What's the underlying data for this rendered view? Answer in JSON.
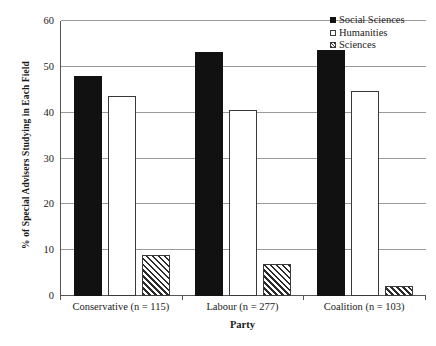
{
  "chart_data": {
    "type": "bar",
    "title": "",
    "xlabel": "Party",
    "ylabel": "% of Special Advisers Studying in Each Field",
    "categories": [
      "Conservative (n = 115)",
      "Labour (n = 277)",
      "Coalition (n = 103)"
    ],
    "series": [
      {
        "name": "Social Sciences",
        "values": [
          48.0,
          53.2,
          53.7
        ],
        "style": "solid-black"
      },
      {
        "name": "Humanities",
        "values": [
          43.6,
          40.6,
          44.8
        ],
        "style": "hollow-white"
      },
      {
        "name": "Sciences",
        "values": [
          9.0,
          7.0,
          2.2
        ],
        "style": "diagonal-hatch"
      }
    ],
    "ylim": [
      0,
      60
    ],
    "yticks": [
      0,
      10,
      20,
      30,
      40,
      50,
      60
    ],
    "ytick_labels": [
      "0",
      "10",
      "20",
      "30",
      "40",
      "50",
      "60"
    ],
    "grid": true,
    "grid_axis": "y",
    "legend_position": "top-right",
    "colors": {
      "social_sciences": "#111111",
      "humanities": "#ffffff",
      "sciences_hatch": "#2b2b2b",
      "axis": "#555555",
      "gridline": "#9a9a9a",
      "text": "#1a1a1a"
    }
  },
  "legend": {
    "items": [
      {
        "label": "Social Sciences",
        "swatch": "filled-square-icon"
      },
      {
        "label": "Humanities",
        "swatch": "hollow-square-icon"
      },
      {
        "label": "Sciences",
        "swatch": "hatched-square-icon"
      }
    ]
  }
}
